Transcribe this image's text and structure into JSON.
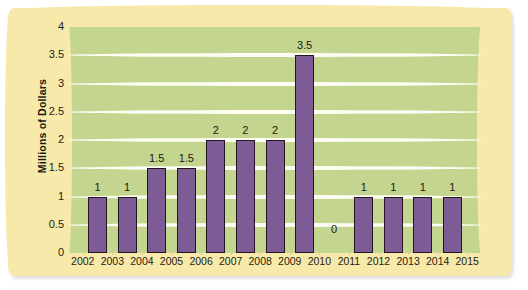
{
  "chart_data": {
    "type": "bar",
    "title": "",
    "subtitle": "",
    "xlabel": "",
    "ylabel": "Millions of Dollars",
    "ylim": [
      0,
      4
    ],
    "ytick_labels": [
      "4",
      "3.5",
      "3",
      "2.5",
      "2",
      "1.5",
      "1",
      "0.5",
      "0"
    ],
    "ytick_values": [
      4,
      3.5,
      3,
      2.5,
      2,
      1.5,
      1,
      0.5,
      0
    ],
    "xtick_labels": [
      "2002",
      "2003",
      "2004",
      "2005",
      "2006",
      "2007",
      "2008",
      "2009",
      "2010",
      "2011",
      "2012",
      "2013",
      "2014",
      "2015"
    ],
    "categories": [
      "2002",
      "2003",
      "2004",
      "2005",
      "2006",
      "2007",
      "2008",
      "2009",
      "2010",
      "2011",
      "2012",
      "2013",
      "2014"
    ],
    "values": [
      1,
      1,
      1.5,
      1.5,
      2,
      2,
      2,
      3.5,
      0,
      1,
      1,
      1,
      1
    ],
    "data_labels": [
      "1",
      "1",
      "1.5",
      "1.5",
      "2",
      "2",
      "2",
      "3.5",
      "0",
      "1",
      "1",
      "1",
      "1"
    ],
    "grid": true,
    "gridlines_axis": "y",
    "legend": false,
    "legend_position": "none",
    "bar_color": "#7d5c96",
    "bar_outline_color": "#23161f",
    "plot_background_color": "#c3d58e",
    "gridline_color": "#fdfdf3",
    "mat_color": "#f6e9a9",
    "page_background_color": "#ffffff",
    "text_color": "#241d14"
  }
}
